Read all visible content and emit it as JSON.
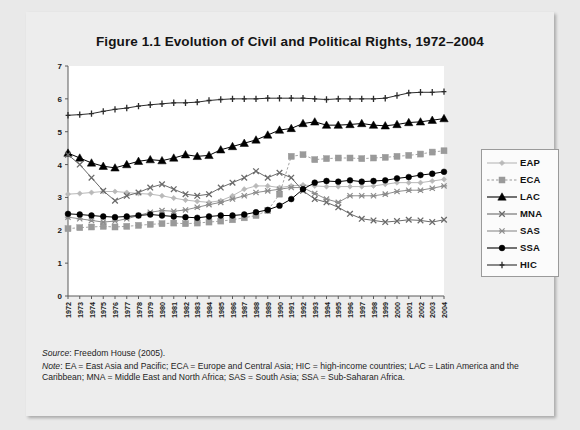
{
  "figure": {
    "title": "Figure 1.1 Evolution of Civil and Political Rights, 1972–2004",
    "source_label": "Source",
    "source_text": ": Freedom House (2005).",
    "note_label": "Note",
    "note_text": ": EA = East Asia and Pacific; ECA = Europe and Central Asia; HIC = high-income countries; LAC = Latin America and the Caribbean; MNA = Middle East and North Africa; SAS = South Asia; SSA = Sub-Saharan Africa."
  },
  "legend": {
    "position": "right",
    "items": [
      {
        "label": "EAP",
        "marker": "diamond",
        "color": "#b9b9b9",
        "dash": "solid"
      },
      {
        "label": "ECA",
        "marker": "square",
        "color": "#9a9a9a",
        "dash": "dashed"
      },
      {
        "label": "LAC",
        "marker": "triangle",
        "color": "#000000",
        "dash": "solid"
      },
      {
        "label": "MNA",
        "marker": "x-cross",
        "color": "#6a6a6a",
        "dash": "solid"
      },
      {
        "label": "SAS",
        "marker": "star-cross",
        "color": "#8d8d8d",
        "dash": "solid"
      },
      {
        "label": "SSA",
        "marker": "circle",
        "color": "#000000",
        "dash": "solid"
      },
      {
        "label": "HIC",
        "marker": "plus",
        "color": "#2b2b2b",
        "dash": "solid"
      }
    ]
  },
  "chart_data": {
    "type": "line",
    "title": "Figure 1.1 Evolution of Civil and Political Rights, 1972–2004",
    "xlabel": "",
    "ylabel": "",
    "ylim": [
      0,
      7
    ],
    "yticks": [
      0,
      1,
      2,
      3,
      4,
      5,
      6,
      7
    ],
    "grid": false,
    "legend_position": "right",
    "x": [
      1972,
      1973,
      1974,
      1975,
      1976,
      1977,
      1978,
      1979,
      1980,
      1981,
      1982,
      1983,
      1984,
      1985,
      1986,
      1987,
      1988,
      1989,
      1990,
      1991,
      1992,
      1993,
      1994,
      1995,
      1996,
      1997,
      1998,
      1999,
      2000,
      2001,
      2002,
      2003,
      2004
    ],
    "categories": [
      "1972",
      "1973",
      "1974",
      "1975",
      "1976",
      "1977",
      "1978",
      "1979",
      "1980",
      "1981",
      "1982",
      "1983",
      "1984",
      "1985",
      "1986",
      "1987",
      "1988",
      "1989",
      "1990",
      "1991",
      "1992",
      "1993",
      "1994",
      "1995",
      "1996",
      "1997",
      "1998",
      "1999",
      "2000",
      "2001",
      "2002",
      "2003",
      "2004"
    ],
    "series": [
      {
        "name": "EAP",
        "marker": "diamond",
        "color": "#b9b9b9",
        "values": [
          3.1,
          3.12,
          3.15,
          3.18,
          3.18,
          3.15,
          3.12,
          3.1,
          3.05,
          2.98,
          2.92,
          2.88,
          2.85,
          2.9,
          3.05,
          3.25,
          3.35,
          3.35,
          3.3,
          3.35,
          3.38,
          3.35,
          3.33,
          3.33,
          3.33,
          3.33,
          3.35,
          3.4,
          3.45,
          3.45,
          3.45,
          3.5,
          3.55
        ]
      },
      {
        "name": "ECA",
        "marker": "square",
        "color": "#9a9a9a",
        "values": [
          2.05,
          2.08,
          2.1,
          2.12,
          2.1,
          2.12,
          2.15,
          2.18,
          2.2,
          2.22,
          2.2,
          2.22,
          2.25,
          2.28,
          2.32,
          2.38,
          2.45,
          2.6,
          3.1,
          4.25,
          4.3,
          4.15,
          4.18,
          4.2,
          4.2,
          4.18,
          4.2,
          4.22,
          4.25,
          4.28,
          4.32,
          4.38,
          4.42
        ]
      },
      {
        "name": "LAC",
        "marker": "triangle",
        "color": "#000000",
        "values": [
          4.35,
          4.2,
          4.05,
          3.95,
          3.9,
          4.0,
          4.1,
          4.15,
          4.12,
          4.2,
          4.3,
          4.25,
          4.28,
          4.45,
          4.55,
          4.65,
          4.75,
          4.9,
          5.05,
          5.1,
          5.25,
          5.3,
          5.2,
          5.2,
          5.22,
          5.25,
          5.2,
          5.18,
          5.22,
          5.28,
          5.3,
          5.35,
          5.4
        ]
      },
      {
        "name": "MNA",
        "marker": "x-cross",
        "color": "#6a6a6a",
        "values": [
          4.3,
          4.0,
          3.6,
          3.2,
          2.9,
          3.05,
          3.15,
          3.3,
          3.4,
          3.25,
          3.1,
          3.05,
          3.1,
          3.3,
          3.45,
          3.6,
          3.8,
          3.6,
          3.75,
          3.6,
          3.2,
          2.95,
          2.85,
          2.7,
          2.5,
          2.35,
          2.3,
          2.25,
          2.28,
          2.32,
          2.3,
          2.25,
          2.32
        ]
      },
      {
        "name": "SAS",
        "marker": "star-cross",
        "color": "#8d8d8d",
        "values": [
          2.4,
          2.35,
          2.3,
          2.25,
          2.28,
          2.35,
          2.45,
          2.55,
          2.6,
          2.58,
          2.62,
          2.7,
          2.78,
          2.85,
          2.95,
          3.05,
          3.15,
          3.2,
          3.25,
          3.3,
          3.3,
          3.12,
          2.95,
          2.85,
          3.05,
          3.05,
          3.05,
          3.1,
          3.18,
          3.22,
          3.22,
          3.28,
          3.35
        ]
      },
      {
        "name": "SSA",
        "marker": "circle",
        "color": "#000000",
        "values": [
          2.5,
          2.48,
          2.45,
          2.42,
          2.4,
          2.42,
          2.45,
          2.48,
          2.45,
          2.42,
          2.4,
          2.38,
          2.42,
          2.45,
          2.45,
          2.48,
          2.55,
          2.62,
          2.75,
          2.95,
          3.25,
          3.45,
          3.5,
          3.48,
          3.52,
          3.48,
          3.5,
          3.52,
          3.58,
          3.62,
          3.68,
          3.72,
          3.78
        ]
      },
      {
        "name": "HIC",
        "marker": "plus",
        "color": "#2b2b2b",
        "values": [
          5.5,
          5.52,
          5.55,
          5.62,
          5.68,
          5.72,
          5.78,
          5.82,
          5.85,
          5.88,
          5.88,
          5.9,
          5.95,
          5.98,
          6.0,
          6.0,
          6.0,
          6.02,
          6.02,
          6.02,
          6.02,
          6.0,
          5.98,
          6.0,
          6.0,
          6.0,
          6.0,
          6.02,
          6.1,
          6.18,
          6.2,
          6.2,
          6.22
        ]
      }
    ]
  }
}
